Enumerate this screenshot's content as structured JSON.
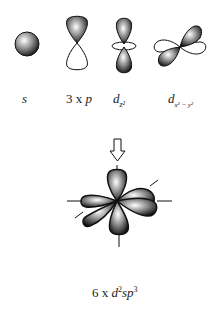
{
  "diagram": {
    "top_row": [
      {
        "id": "s",
        "label": "s"
      },
      {
        "id": "p",
        "label_prefix": "3 x ",
        "label": "p"
      },
      {
        "id": "dz2",
        "label_base": "d",
        "label_sub": "z²"
      },
      {
        "id": "dx2y2",
        "label_base": "d",
        "label_sub": "x² − y²"
      }
    ],
    "arrow": {
      "direction": "down",
      "style": "hollow"
    },
    "result": {
      "count_prefix": "6 x",
      "label_base": "d",
      "label_sup1": "2",
      "label_mid": "sp",
      "label_sup2": "3"
    }
  }
}
